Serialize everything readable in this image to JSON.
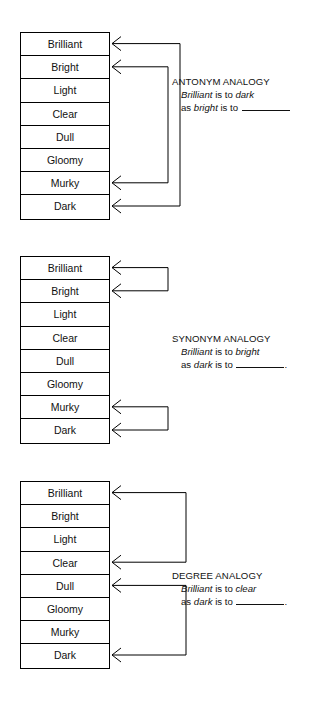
{
  "page": {
    "width": 310,
    "height": 708,
    "background": "#ffffff",
    "line_color": "#000000",
    "text_color": "#111111"
  },
  "words": [
    "Brilliant",
    "Bright",
    "Light",
    "Clear",
    "Dull",
    "Gloomy",
    "Murky",
    "Dark"
  ],
  "diagrams": [
    {
      "id": "antonym",
      "table_top": 32,
      "caption_top": 76,
      "caption_left": 172,
      "title": "ANTONYM ANALOGY",
      "line1_pre": "",
      "line1_em1": "Brilliant",
      "line1_mid": " is to ",
      "line1_em2": "dark",
      "line1_post": "",
      "line2_pre": "as ",
      "line2_em1": "bright",
      "line2_mid": " is to ",
      "line2_post": "",
      "rows": [
        "Brilliant",
        "Bright",
        "Light",
        "Clear",
        "Dull",
        "Gloomy",
        "Murky",
        "Dark"
      ],
      "arrows": [
        {
          "name": "brilliant-to-dark",
          "from_row": 7,
          "to_row": 0,
          "depth": 70
        },
        {
          "name": "bright-to-murky",
          "from_row": 6,
          "to_row": 1,
          "depth": 58
        }
      ]
    },
    {
      "id": "synonym",
      "table_top": 256,
      "caption_top": 333,
      "caption_left": 172,
      "title": "SYNONYM ANALOGY",
      "line1_em1": "Brilliant",
      "line1_mid": " is to ",
      "line1_em2": "bright",
      "line2_pre": "as ",
      "line2_em1": "dark",
      "line2_mid": " is to ",
      "line2_post": ".",
      "rows": [
        "Brilliant",
        "Bright",
        "Light",
        "Clear",
        "Dull",
        "Gloomy",
        "Murky",
        "Dark"
      ],
      "arrows": [
        {
          "name": "brilliant-to-bright",
          "from_row": 0,
          "to_row": 1,
          "depth": 58
        },
        {
          "name": "murky-to-dark",
          "from_row": 6,
          "to_row": 7,
          "depth": 58
        }
      ]
    },
    {
      "id": "degree",
      "table_top": 481,
      "caption_top": 570,
      "caption_left": 172,
      "title": "DEGREE ANALOGY",
      "line1_em1": "Brilliant",
      "line1_mid": " is to ",
      "line1_em2": "clear",
      "line2_pre": "as ",
      "line2_em1": "dark",
      "line2_mid": " is to ",
      "line2_post": ".",
      "rows": [
        "Brilliant",
        "Bright",
        "Light",
        "Clear",
        "Dull",
        "Gloomy",
        "Murky",
        "Dark"
      ],
      "arrows": [
        {
          "name": "brilliant-to-clear",
          "from_row": 0,
          "to_row": 3,
          "depth": 76
        },
        {
          "name": "dull-to-dark",
          "from_row": 4,
          "to_row": 7,
          "depth": 76
        }
      ]
    }
  ]
}
